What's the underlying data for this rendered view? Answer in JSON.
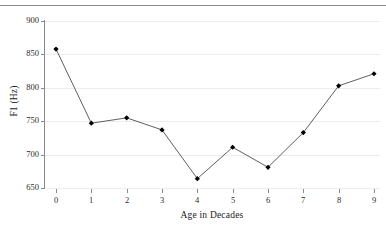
{
  "figure": {
    "top_caption": "",
    "background_color": "#ffffff",
    "rule_color": "#8b8b8b"
  },
  "chart_data": {
    "type": "line",
    "title": "",
    "subtitle": "",
    "xlabel": "Age in Decades",
    "ylabel": "F1 (Hz)",
    "x": [
      0,
      1,
      2,
      3,
      4,
      5,
      6,
      7,
      8,
      9
    ],
    "categories": [
      "0",
      "1",
      "2",
      "3",
      "4",
      "5",
      "6",
      "7",
      "8",
      "9"
    ],
    "values": [
      858,
      747,
      755,
      737,
      664,
      711,
      681,
      733,
      803,
      821
    ],
    "series": [
      {
        "name": "F1",
        "values": [
          858,
          747,
          755,
          737,
          664,
          711,
          681,
          733,
          803,
          821
        ],
        "line_color": "#4d4d4d",
        "marker": "diamond",
        "marker_color": "#000000"
      }
    ],
    "xlim": [
      0,
      9
    ],
    "ylim": [
      650,
      900
    ],
    "yticks": [
      650,
      700,
      750,
      800,
      850,
      900
    ],
    "ytick_labels": [
      "650",
      "700",
      "750",
      "800",
      "850",
      "900"
    ],
    "xticks": [
      0,
      1,
      2,
      3,
      4,
      5,
      6,
      7,
      8,
      9
    ],
    "xtick_labels": [
      "0",
      "1",
      "2",
      "3",
      "4",
      "5",
      "6",
      "7",
      "8",
      "9"
    ],
    "grid": true,
    "grid_axis": "y",
    "grid_color": "#ececed",
    "legend": false,
    "legend_position": "none",
    "annotations": []
  }
}
